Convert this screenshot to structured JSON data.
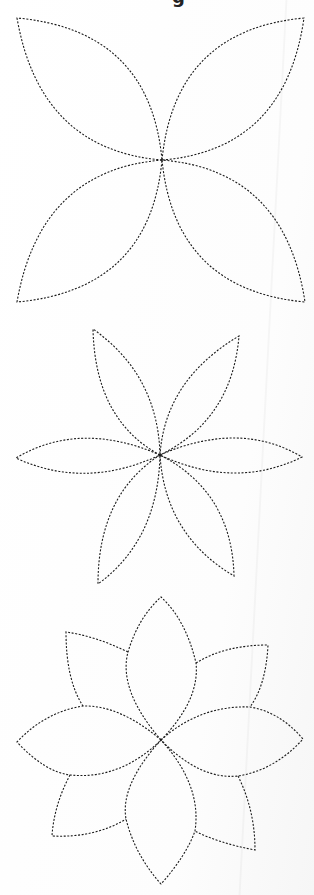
{
  "page": {
    "title_fragment": "g",
    "background_color": "#ffffff",
    "line_color": "#1a1a1a",
    "line_style": "dotted"
  },
  "templates": [
    {
      "name": "four-petal-flower",
      "petal_count": 4,
      "center": [
        162,
        160
      ],
      "petals": [
        {
          "tip": [
            17,
            18
          ],
          "label": "upper-left petal"
        },
        {
          "tip": [
            304,
            18
          ],
          "label": "upper-right petal"
        },
        {
          "tip": [
            17,
            302
          ],
          "label": "lower-left petal"
        },
        {
          "tip": [
            305,
            302
          ],
          "label": "lower-right petal"
        }
      ]
    },
    {
      "name": "six-petal-flower",
      "petal_count": 6,
      "center": [
        160,
        455
      ],
      "petals": [
        {
          "tip": [
            93,
            329
          ],
          "label": "upper-left petal"
        },
        {
          "tip": [
            239,
            336
          ],
          "label": "upper-right petal"
        },
        {
          "tip": [
            16,
            458
          ],
          "label": "left petal"
        },
        {
          "tip": [
            302,
            457
          ],
          "label": "right petal"
        },
        {
          "tip": [
            98,
            584
          ],
          "label": "lower-left petal"
        },
        {
          "tip": [
            234,
            576
          ],
          "label": "lower-right petal"
        }
      ]
    },
    {
      "name": "eight-petal-layered-flower",
      "petal_count": 8,
      "center": [
        161,
        740
      ],
      "front_petals": [
        {
          "tip": [
            161,
            597
          ],
          "label": "top petal"
        },
        {
          "tip": [
            17,
            742
          ],
          "label": "left petal"
        },
        {
          "tip": [
            303,
            739
          ],
          "label": "right petal"
        },
        {
          "tip": [
            161,
            884
          ],
          "label": "bottom petal"
        }
      ],
      "back_petals": [
        {
          "corner": [
            66,
            632
          ],
          "label": "upper-left back petal"
        },
        {
          "corner": [
            268,
            645
          ],
          "label": "upper-right back petal"
        },
        {
          "corner": [
            52,
            836
          ],
          "label": "lower-left back petal"
        },
        {
          "corner": [
            255,
            850
          ],
          "label": "lower-right back petal"
        }
      ]
    }
  ]
}
